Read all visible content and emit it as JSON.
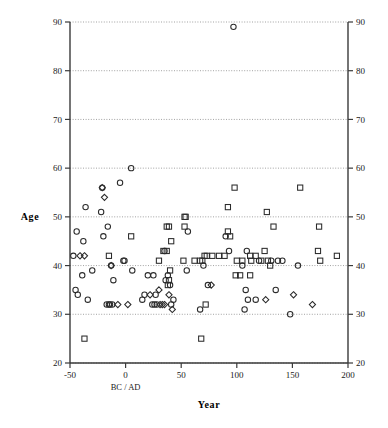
{
  "chart_data": {
    "type": "scatter",
    "title": "",
    "xlabel": "Year",
    "ylabel": "Age",
    "xlim": [
      -50,
      200
    ],
    "ylim": [
      20,
      90
    ],
    "xticks": [
      -50,
      0,
      50,
      100,
      150,
      200
    ],
    "yticks": [
      20,
      30,
      40,
      50,
      60,
      70,
      80,
      90
    ],
    "grid": true,
    "grid_axis": "y",
    "grid_style": "dotted",
    "legend": "none",
    "mirrored_y_axis": true,
    "annotations": [
      {
        "text": "BC / AD",
        "x": 0,
        "placement": "below-x-axis-at-zero"
      }
    ],
    "series": [
      {
        "name": "circle",
        "marker": "circle",
        "points": [
          [
            97,
            89
          ],
          [
            5,
            60
          ],
          [
            -5,
            57
          ],
          [
            -21,
            56
          ],
          [
            -36,
            52
          ],
          [
            -22,
            51
          ],
          [
            -16,
            48
          ],
          [
            -44,
            47
          ],
          [
            56,
            47
          ],
          [
            -38,
            45
          ],
          [
            -20,
            46
          ],
          [
            -47,
            42
          ],
          [
            -2,
            41
          ],
          [
            -1,
            41
          ],
          [
            93,
            43
          ],
          [
            109,
            43
          ],
          [
            -13,
            40
          ],
          [
            70,
            40
          ],
          [
            131,
            41
          ],
          [
            137,
            41
          ],
          [
            141,
            41
          ],
          [
            155,
            40
          ],
          [
            -30,
            39
          ],
          [
            6,
            39
          ],
          [
            55,
            39
          ],
          [
            20,
            38
          ],
          [
            25,
            38
          ],
          [
            -39,
            38
          ],
          [
            -11,
            37
          ],
          [
            35,
            43
          ],
          [
            74,
            36
          ],
          [
            135,
            35
          ],
          [
            108,
            35
          ],
          [
            -43,
            34
          ],
          [
            15,
            33
          ],
          [
            17,
            34
          ],
          [
            27,
            34
          ],
          [
            110,
            33
          ],
          [
            -45,
            35
          ],
          [
            -34,
            33
          ],
          [
            -17,
            32
          ],
          [
            -15,
            32
          ],
          [
            -14,
            32
          ],
          [
            -12,
            32
          ],
          [
            24,
            32
          ],
          [
            26,
            32
          ],
          [
            28,
            32
          ],
          [
            41,
            32
          ],
          [
            43,
            33
          ],
          [
            67,
            31
          ],
          [
            107,
            31
          ],
          [
            117,
            33
          ],
          [
            148,
            30
          ],
          [
            40,
            36
          ],
          [
            36,
            37
          ],
          [
            38,
            38
          ],
          [
            105,
            40
          ],
          [
            120,
            41
          ],
          [
            90,
            46
          ]
        ]
      },
      {
        "name": "diamond",
        "marker": "diamond",
        "points": [
          [
            -21,
            56
          ],
          [
            -19,
            54
          ],
          [
            -41,
            42
          ],
          [
            -37,
            42
          ],
          [
            -13,
            40
          ],
          [
            -7,
            32
          ],
          [
            2,
            32
          ],
          [
            22,
            34
          ],
          [
            31,
            32
          ],
          [
            33,
            32
          ],
          [
            35,
            32
          ],
          [
            42,
            31
          ],
          [
            77,
            36
          ],
          [
            168,
            32
          ],
          [
            151,
            34
          ],
          [
            39,
            34
          ],
          [
            126,
            33
          ],
          [
            30,
            35
          ]
        ]
      },
      {
        "name": "square",
        "marker": "square",
        "points": [
          [
            98,
            56
          ],
          [
            157,
            56
          ],
          [
            92,
            52
          ],
          [
            127,
            51
          ],
          [
            53,
            50
          ],
          [
            54,
            50
          ],
          [
            37,
            48
          ],
          [
            39,
            48
          ],
          [
            53,
            48
          ],
          [
            133,
            48
          ],
          [
            174,
            48
          ],
          [
            92,
            47
          ],
          [
            94,
            46
          ],
          [
            5,
            46
          ],
          [
            41,
            45
          ],
          [
            173,
            43
          ],
          [
            125,
            43
          ],
          [
            -15,
            42
          ],
          [
            34,
            43
          ],
          [
            37,
            43
          ],
          [
            78,
            42
          ],
          [
            84,
            42
          ],
          [
            89,
            42
          ],
          [
            112,
            42
          ],
          [
            117,
            42
          ],
          [
            71,
            42
          ],
          [
            73,
            42
          ],
          [
            190,
            42
          ],
          [
            30,
            41
          ],
          [
            52,
            41
          ],
          [
            62,
            41
          ],
          [
            67,
            41
          ],
          [
            69,
            41
          ],
          [
            100,
            41
          ],
          [
            105,
            41
          ],
          [
            113,
            41
          ],
          [
            122,
            41
          ],
          [
            128,
            41
          ],
          [
            130,
            40
          ],
          [
            175,
            41
          ],
          [
            40,
            39
          ],
          [
            99,
            38
          ],
          [
            103,
            38
          ],
          [
            112,
            38
          ],
          [
            39,
            37
          ],
          [
            38,
            36
          ],
          [
            72,
            32
          ],
          [
            -37,
            25
          ],
          [
            68,
            25
          ]
        ]
      }
    ]
  }
}
